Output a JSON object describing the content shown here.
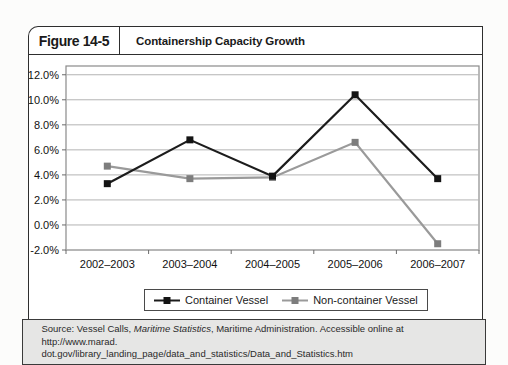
{
  "figure": {
    "label": "Figure 14-5",
    "title": "Containership Capacity Growth"
  },
  "chart_data": {
    "type": "line",
    "title": "Containership Capacity Growth",
    "xlabel": "",
    "ylabel": "",
    "categories": [
      "2002–2003",
      "2003–2004",
      "2004–2005",
      "2005–2006",
      "2006–2007"
    ],
    "series": [
      {
        "name": "Container Vessel",
        "values": [
          3.3,
          6.8,
          3.9,
          10.4,
          3.7
        ],
        "line_color": "#1c1c1c",
        "marker_color": "#141414"
      },
      {
        "name": "Non-container Vessel",
        "values": [
          4.7,
          3.7,
          3.8,
          6.6,
          -1.5
        ],
        "line_color": "#9a9a9a",
        "marker_color": "#7d7d7d"
      }
    ],
    "y_ticks": [
      "12.0%",
      "10.0%",
      "8.0%",
      "6.0%",
      "4.0%",
      "2.0%",
      "0.0%",
      "-2.0%"
    ],
    "y_tick_values": [
      12,
      10,
      8,
      6,
      4,
      2,
      0,
      -2
    ],
    "ylim": [
      -2,
      12.7
    ],
    "grid": true,
    "legend_position": "bottom-center",
    "colors": {
      "gridline": "#b3b3b3",
      "plot_border": "#8a8a8a",
      "axis_text": "#111111",
      "tick": "#6a6a6a"
    }
  },
  "source": {
    "prefix": "Source: Vessel Calls, ",
    "italic_title": "Maritime Statistics",
    "suffix": ", Maritime Administration. Accessible online at http://www.marad.",
    "line2": "dot.gov/library_landing_page/data_and_statistics/Data_and_Statistics.htm"
  }
}
